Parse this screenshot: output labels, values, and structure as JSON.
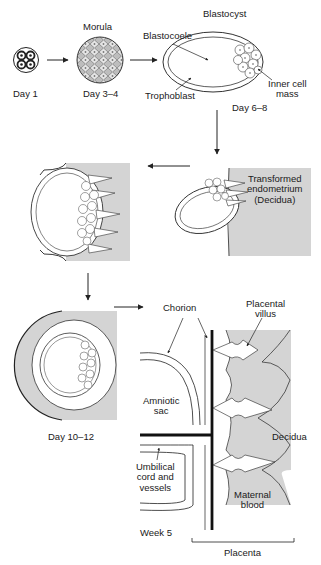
{
  "stages": {
    "day1": {
      "label": "Day 1"
    },
    "morula": {
      "title": "Morula",
      "label": "Day 3–4"
    },
    "blastocyst": {
      "title": "Blastocyst",
      "label": "Day 6–8",
      "parts": {
        "blastocoele": "Blastocoele",
        "trophoblast": "Trophoblast",
        "inner_cell_mass_line1": "Inner cell",
        "inner_cell_mass_line2": "mass"
      }
    },
    "implantation": {
      "endometrium_line1": "Transformed",
      "endometrium_line2": "endometrium",
      "endometrium_line3": "(Decidua)"
    },
    "day10_12": {
      "label": "Day 10–12"
    },
    "week5": {
      "label": "Week 5",
      "parts": {
        "chorion": "Chorion",
        "placental_villus_line1": "Placental",
        "placental_villus_line2": "villus",
        "amniotic_sac_line1": "Amniotic",
        "amniotic_sac_line2": "sac",
        "umbilical_line1": "Umbilical",
        "umbilical_line2": "cord and",
        "umbilical_line3": "vessels",
        "decidua": "Decidua",
        "maternal_blood_line1": "Maternal",
        "maternal_blood_line2": "blood",
        "placenta": "Placenta"
      }
    }
  },
  "colors": {
    "decidua_fill": "#d4d4d4",
    "line": "#222222",
    "background": "#ffffff"
  }
}
